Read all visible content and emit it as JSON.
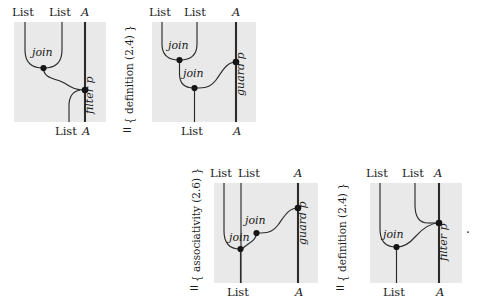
{
  "figure": {
    "kind": "string-diagram-equational-proof",
    "background_color": "#ffffff",
    "diagram_panel_color": "#e9e9e9",
    "wire_color": "#2b2b2b",
    "node_color": "#151515",
    "end_mark": "."
  },
  "steps": [
    {
      "id": "step-1",
      "equals": "=",
      "justification": "{ definition (2.4) }"
    },
    {
      "id": "step-2",
      "equals": "=",
      "justification": "{ associativity (2.6) }"
    },
    {
      "id": "step-3",
      "equals": "=",
      "justification": "{ definition (2.4) }"
    }
  ],
  "diagrams": [
    {
      "id": "diagram-1",
      "position": "top-left",
      "top_ports": [
        "List",
        "List",
        "A"
      ],
      "bottom_ports": [
        "List",
        "A"
      ],
      "operations": [
        "join"
      ],
      "side_label": "filter p",
      "node_count": 2
    },
    {
      "id": "diagram-2",
      "position": "top-right",
      "top_ports": [
        "List",
        "List",
        "A"
      ],
      "bottom_ports": [
        "List",
        "A"
      ],
      "operations": [
        "join",
        "join"
      ],
      "side_label": "guard p",
      "node_count": 3
    },
    {
      "id": "diagram-3",
      "position": "bottom-left",
      "top_ports": [
        "List",
        "List",
        "A"
      ],
      "bottom_ports": [
        "List",
        "A"
      ],
      "operations": [
        "join",
        "join"
      ],
      "side_label": "guard p",
      "node_count": 3
    },
    {
      "id": "diagram-4",
      "position": "bottom-right",
      "top_ports": [
        "List",
        "List",
        "A"
      ],
      "bottom_ports": [
        "List",
        "A"
      ],
      "operations": [
        "join"
      ],
      "side_label": "filter p",
      "node_count": 2
    }
  ]
}
